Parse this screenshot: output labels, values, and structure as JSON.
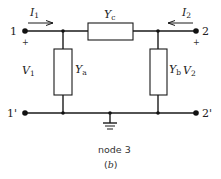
{
  "diagram": {
    "type": "two-port pi network (admittance)",
    "ports": {
      "port1": {
        "terminal_top": "1",
        "terminal_bottom": "1'",
        "voltage": "V",
        "voltage_sub": "1",
        "current": "I",
        "current_sub": "1",
        "polarity": "+"
      },
      "port2": {
        "terminal_top": "2",
        "terminal_bottom": "2'",
        "voltage": "V",
        "voltage_sub": "2",
        "current": "I",
        "current_sub": "2",
        "polarity": "+"
      }
    },
    "elements": {
      "series": {
        "symbol": "Y",
        "sub": "c"
      },
      "shunt_left": {
        "symbol": "Y",
        "sub": "a"
      },
      "shunt_right": {
        "symbol": "Y",
        "sub": "b"
      }
    },
    "ground_label": "node 3",
    "caption_open": "(",
    "caption_letter": "b",
    "caption_close": ")"
  }
}
